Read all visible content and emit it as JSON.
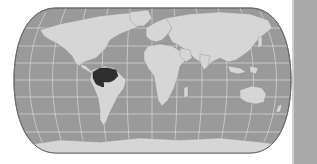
{
  "map": {
    "projection": "Robinson-like world projection",
    "colors": {
      "ocean": "#9a9a9a",
      "land": "#d6d6d6",
      "highlight": "#2f2f2f",
      "graticule": "#e4e4e4",
      "border": "#6a6a6a",
      "background": "#ffffff",
      "side_strip": "#a9a9a9"
    },
    "highlighted_region": {
      "label": "Amazon basin (northern South America)"
    }
  }
}
